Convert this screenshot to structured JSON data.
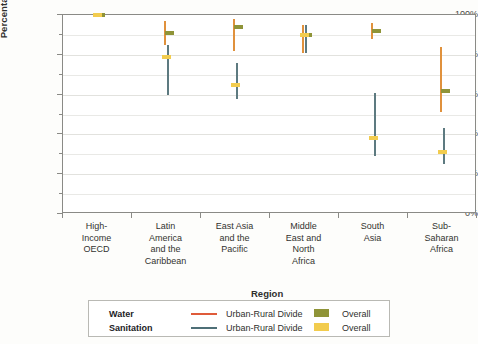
{
  "chart_data": {
    "type": "scatter",
    "title": "",
    "xlabel": "Region",
    "ylabel": "Percentage with Access",
    "ylim": [
      0,
      100
    ],
    "ytick_labels": [
      "0%",
      "20%",
      "40%",
      "60%",
      "80%",
      "100%"
    ],
    "ytick_values": [
      0,
      20,
      40,
      60,
      80,
      100
    ],
    "minor_tick_values": [
      10,
      30,
      50,
      70,
      90
    ],
    "grid": true,
    "legend_position": "bottom",
    "categories": [
      "High-Income OECD",
      "Latin America and the Caribbean",
      "East Asia and the Pacific",
      "Middle East and North Africa",
      "South Asia",
      "Sub-Saharan Africa"
    ],
    "category_lines": [
      [
        "High-",
        "Income",
        "OECD"
      ],
      [
        "Latin",
        "America",
        "and the",
        "Caribbean"
      ],
      [
        "East Asia",
        "and the",
        "Pacific"
      ],
      [
        "Middle",
        "East and",
        "North",
        "Africa"
      ],
      [
        "South",
        "Asia"
      ],
      [
        "Sub-",
        "Saharan",
        "Africa"
      ]
    ],
    "series": [
      {
        "name": "Water Urban-Rural Divide",
        "type": "range",
        "color": "#e0913c",
        "low": [
          99,
          85,
          82,
          81,
          88,
          51
        ],
        "high": [
          100,
          97,
          98,
          95,
          96,
          84
        ]
      },
      {
        "name": "Water Overall",
        "type": "marker",
        "color": "#8f9438",
        "values": [
          100,
          91,
          94,
          90,
          92,
          62
        ]
      },
      {
        "name": "Sanitation Urban-Rural Divide",
        "type": "range",
        "color": "#5d7a80",
        "low": [
          99,
          60,
          58,
          81,
          29,
          25
        ],
        "high": [
          100,
          85,
          76,
          95,
          61,
          43
        ]
      },
      {
        "name": "Sanitation Overall",
        "type": "marker",
        "color": "#f2cc4e",
        "values": [
          100,
          79,
          65,
          90,
          38,
          31
        ]
      }
    ]
  },
  "legend": {
    "rows": [
      {
        "category": "Water",
        "line_label": "Urban-Rural Divide",
        "swatch_label": "Overall",
        "line_color": "#df5b3a",
        "swatch_color": "#8f9438"
      },
      {
        "category": "Sanitation",
        "line_label": "Urban-Rural Divide",
        "swatch_label": "Overall",
        "line_color": "#4e6f77",
        "swatch_color": "#f2cc4e"
      }
    ]
  },
  "colors": {
    "water_divide": "#e0913c",
    "water_overall": "#8f9438",
    "sanitation_divide": "#5d7a80",
    "sanitation_overall": "#f2cc4e",
    "axis": "#8a8a86",
    "grid": "#e9e9e6"
  }
}
